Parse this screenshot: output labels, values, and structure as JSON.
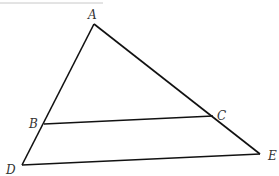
{
  "diagram": {
    "type": "triangle-with-parallel-segment",
    "top_rule_color": "#c8c8c8",
    "line_color": "#111111",
    "points": {
      "A": {
        "label": "A",
        "x": 94,
        "y": 24
      },
      "B": {
        "label": "B",
        "x": 44,
        "y": 124
      },
      "C": {
        "label": "C",
        "x": 213,
        "y": 116
      },
      "D": {
        "label": "D",
        "x": 22,
        "y": 165
      },
      "E": {
        "label": "E",
        "x": 260,
        "y": 154
      }
    },
    "segments": [
      "AD",
      "AE",
      "DE",
      "BC"
    ]
  }
}
